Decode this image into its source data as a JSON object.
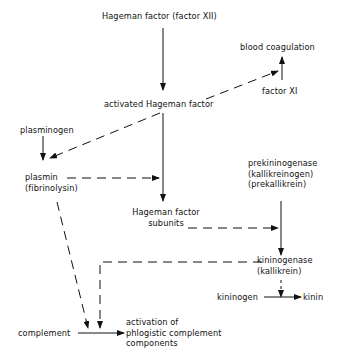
{
  "nodes": {
    "hageman_factor": "Hageman factor (factor XII)",
    "blood_coagulation": "blood coagulation",
    "factor_xi": "factor XI",
    "activated_hageman": "activated Hageman factor",
    "plasminogen": "plasminogen",
    "plasmin_l1": "plasmin",
    "plasmin_l2": "(fibrinolysin)",
    "prekininogenase_l1": "prekininogenase",
    "prekininogenase_l2": "(kallikreinogen)",
    "prekininogenase_l3": "(prekallikrein)",
    "hf_subunits_l1": "Hageman factor",
    "hf_subunits_l2": "subunits",
    "kininogenase_l1": "kininogenase",
    "kininogenase_l2": "(kallikrein)",
    "kininogen": "kininogen",
    "kinin": "kinin",
    "complement": "complement",
    "activation_l1": "activation of",
    "activation_l2": "phlogistic complement",
    "activation_l3": "components"
  },
  "edges": [
    {
      "from": "hageman_factor",
      "to": "activated_hageman",
      "style": "solid"
    },
    {
      "from": "activated_hageman",
      "to": "blood_coagulation",
      "style": "dashed"
    },
    {
      "from": "factor_xi",
      "to": "blood_coagulation",
      "style": "solid"
    },
    {
      "from": "activated_hageman",
      "to": "plasmin",
      "style": "dashed"
    },
    {
      "from": "plasminogen",
      "to": "plasmin",
      "style": "solid"
    },
    {
      "from": "activated_hageman",
      "to": "hf_subunits",
      "style": "solid"
    },
    {
      "from": "plasmin",
      "to": "hf_subunits",
      "style": "dashed"
    },
    {
      "from": "hf_subunits",
      "to": "prekininogenase_to_kininogenase",
      "style": "dashed"
    },
    {
      "from": "prekininogenase",
      "to": "kininogenase",
      "style": "solid"
    },
    {
      "from": "kininogenase",
      "to": "kininogen_to_kinin",
      "style": "dashed"
    },
    {
      "from": "kininogen",
      "to": "kinin",
      "style": "solid"
    },
    {
      "from": "plasmin",
      "to": "complement_activation",
      "style": "dashed"
    },
    {
      "from": "kininogenase",
      "to": "complement_activation",
      "style": "dashed"
    },
    {
      "from": "complement",
      "to": "activation",
      "style": "solid"
    }
  ]
}
